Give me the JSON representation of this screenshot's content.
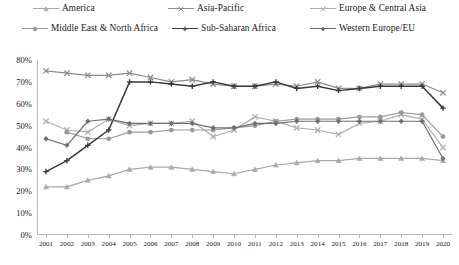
{
  "chart_data": {
    "type": "line",
    "title": "",
    "subtitle": "",
    "xlabel": "",
    "ylabel": "",
    "grid": false,
    "legend_position": "top",
    "x": [
      2001,
      2002,
      2003,
      2004,
      2005,
      2006,
      2007,
      2008,
      2009,
      2010,
      2011,
      2012,
      2013,
      2014,
      2015,
      2016,
      2017,
      2018,
      2019,
      2020
    ],
    "xtick_labels": [
      "2001",
      "2002",
      "2003",
      "2004",
      "2005",
      "2006",
      "2007",
      "2008",
      "2009",
      "2010",
      "2011",
      "2012",
      "2013",
      "2014",
      "2015",
      "2016",
      "2017",
      "2018",
      "2019",
      "2020"
    ],
    "ytick_labels": [
      "0%",
      "10%",
      "20%",
      "30%",
      "40%",
      "50%",
      "60%",
      "70%",
      "80%"
    ],
    "ytick_values": [
      0,
      10,
      20,
      30,
      40,
      50,
      60,
      70,
      80
    ],
    "ylim": [
      0,
      80
    ],
    "y_unit": "%",
    "series": [
      {
        "name": "America",
        "color": "#a9a9a9",
        "marker": "triangle",
        "values": [
          22,
          22,
          25,
          27,
          30,
          31,
          31,
          30,
          29,
          28,
          30,
          32,
          33,
          34,
          34,
          35,
          35,
          35,
          35,
          34
        ]
      },
      {
        "name": "Asia-Pacific",
        "color": "#8c8c8c",
        "marker": "x",
        "values": [
          75,
          74,
          73,
          73,
          74,
          72,
          70,
          71,
          69,
          68,
          68,
          69,
          68,
          70,
          67,
          67,
          69,
          69,
          69,
          65
        ]
      },
      {
        "name": "Europe & Central Asia",
        "color": "#b0b0b0",
        "marker": "x",
        "values": [
          52,
          48,
          47,
          53,
          50,
          51,
          51,
          52,
          45,
          48,
          54,
          52,
          49,
          48,
          46,
          51,
          52,
          55,
          53,
          40
        ]
      },
      {
        "name": "Middle East & North Africa",
        "color": "#9a9a9a",
        "marker": "circle",
        "values": [
          null,
          47,
          44,
          44,
          47,
          47,
          48,
          48,
          48,
          49,
          50,
          52,
          53,
          53,
          53,
          54,
          54,
          56,
          55,
          45
        ]
      },
      {
        "name": "Sub-Saharan Africa",
        "color": "#3a3a3a",
        "marker": "plus",
        "values": [
          29,
          34,
          41,
          48,
          70,
          70,
          69,
          68,
          70,
          68,
          68,
          70,
          67,
          68,
          66,
          67,
          68,
          68,
          68,
          58
        ]
      },
      {
        "name": "Western Europe/EU",
        "color": "#6e6e6e",
        "marker": "diamond",
        "values": [
          44,
          41,
          52,
          53,
          51,
          51,
          51,
          51,
          49,
          49,
          51,
          51,
          52,
          52,
          52,
          52,
          52,
          52,
          52,
          35
        ]
      }
    ]
  },
  "legend": {
    "items": [
      {
        "label": "America",
        "key": "america"
      },
      {
        "label": "Asia-Pacific",
        "key": "asia"
      },
      {
        "label": "Europe & Central Asia",
        "key": "euro-ca"
      },
      {
        "label": "Middle East & North Africa",
        "key": "mena"
      },
      {
        "label": "Sub-Saharan Africa",
        "key": "ssa"
      },
      {
        "label": "Western Europe/EU",
        "key": "weu"
      }
    ]
  }
}
